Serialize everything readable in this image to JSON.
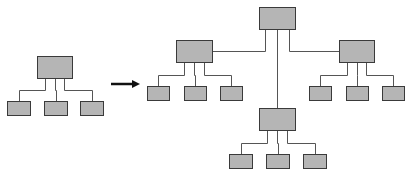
{
  "diagram": {
    "type": "hierarchy-expansion",
    "colors": {
      "box_fill": "#b5b5b5",
      "box_stroke": "#3a3a3a",
      "connector": "#555555",
      "arrow": "#111111"
    },
    "left_tree": {
      "root": {
        "x": 37,
        "y": 56,
        "w": 35,
        "h": 22
      },
      "children": [
        {
          "x": 7,
          "y": 101,
          "w": 23,
          "h": 14
        },
        {
          "x": 44,
          "y": 101,
          "w": 23,
          "h": 14
        },
        {
          "x": 80,
          "y": 101,
          "w": 23,
          "h": 14
        }
      ]
    },
    "arrow": {
      "x1": 111,
      "y1": 84,
      "x2": 140,
      "y2": 84
    },
    "right_tree": {
      "root": {
        "x": 259,
        "y": 7,
        "w": 36,
        "h": 22
      },
      "branches": [
        {
          "node": {
            "x": 176,
            "y": 40,
            "w": 36,
            "h": 22
          },
          "children": [
            {
              "x": 147,
              "y": 86,
              "w": 22,
              "h": 14
            },
            {
              "x": 184,
              "y": 86,
              "w": 22,
              "h": 14
            },
            {
              "x": 220,
              "y": 86,
              "w": 22,
              "h": 14
            }
          ]
        },
        {
          "node": {
            "x": 339,
            "y": 40,
            "w": 35,
            "h": 22
          },
          "children": [
            {
              "x": 309,
              "y": 86,
              "w": 22,
              "h": 14
            },
            {
              "x": 346,
              "y": 86,
              "w": 22,
              "h": 14
            },
            {
              "x": 382,
              "y": 86,
              "w": 22,
              "h": 14
            }
          ]
        },
        {
          "node": {
            "x": 259,
            "y": 108,
            "w": 36,
            "h": 22
          },
          "children": [
            {
              "x": 229,
              "y": 154,
              "w": 23,
              "h": 14
            },
            {
              "x": 266,
              "y": 154,
              "w": 23,
              "h": 14
            },
            {
              "x": 303,
              "y": 154,
              "w": 23,
              "h": 14
            }
          ]
        }
      ]
    }
  }
}
